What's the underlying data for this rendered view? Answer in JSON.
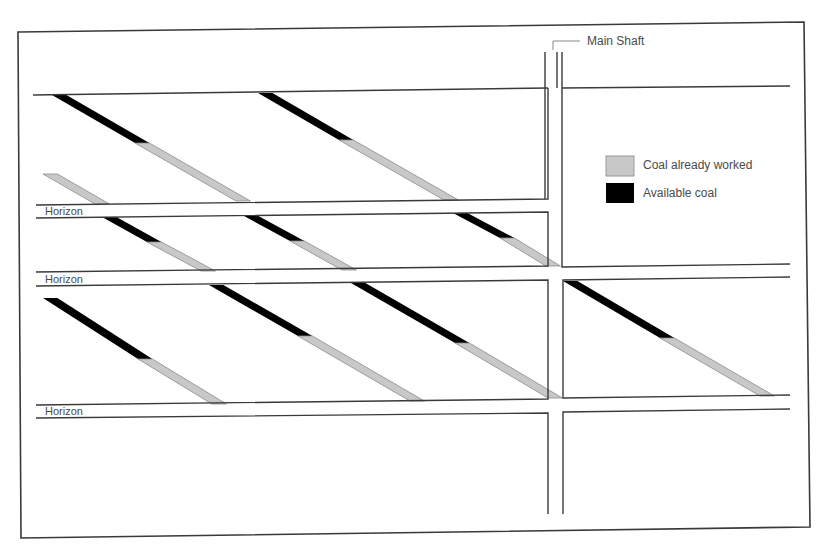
{
  "diagram": {
    "title_label": "Main Shaft",
    "horizon_labels": [
      "Horizon",
      "Horizon",
      "Horizon"
    ],
    "legend": {
      "items": [
        {
          "label": "Coal already worked",
          "color": "#c8c8c8",
          "name": "legend-coal-worked"
        },
        {
          "label": "Available coal",
          "color": "#000000",
          "name": "legend-available-coal"
        }
      ]
    },
    "colors": {
      "line": "#3a3a3a",
      "worked_coal": "#c8c8c8",
      "available_coal": "#000000",
      "background": "#ffffff"
    },
    "seams": [
      {
        "row": 1,
        "start": [
          52,
          95
        ],
        "split": [
          135,
          143
        ],
        "end": [
          236,
          201
        ],
        "cut_start": false
      },
      {
        "row": 1,
        "start": [
          258,
          93
        ],
        "split": [
          339,
          140
        ],
        "end": [
          444,
          200
        ],
        "cut_start": false
      },
      {
        "row": 1,
        "start": [
          43,
          174
        ],
        "split": [
          43,
          174
        ],
        "end": [
          95,
          204
        ],
        "cut_start": true
      },
      {
        "row": 2,
        "start": [
          102,
          217
        ],
        "split": [
          147,
          242
        ],
        "end": [
          201,
          271
        ],
        "cut_start": false
      },
      {
        "row": 2,
        "start": [
          244,
          216
        ],
        "split": [
          290,
          241
        ],
        "end": [
          342,
          270
        ],
        "cut_start": false
      },
      {
        "row": 2,
        "start": [
          453,
          213
        ],
        "split": [
          500,
          238
        ],
        "end": [
          546,
          266
        ],
        "cut_start": false
      },
      {
        "row": 3,
        "start": [
          43,
          298
        ],
        "split": [
          138,
          359
        ],
        "end": [
          212,
          404
        ],
        "cut_start": true
      },
      {
        "row": 3,
        "start": [
          209,
          285
        ],
        "split": [
          298,
          336
        ],
        "end": [
          410,
          401
        ],
        "cut_start": false
      },
      {
        "row": 3,
        "start": [
          351,
          283
        ],
        "split": [
          455,
          343
        ],
        "end": [
          548,
          398
        ],
        "cut_start": false
      },
      {
        "row": 3,
        "start": [
          563,
          281
        ],
        "split": [
          660,
          338
        ],
        "end": [
          760,
          396
        ],
        "cut_start": false
      }
    ]
  }
}
